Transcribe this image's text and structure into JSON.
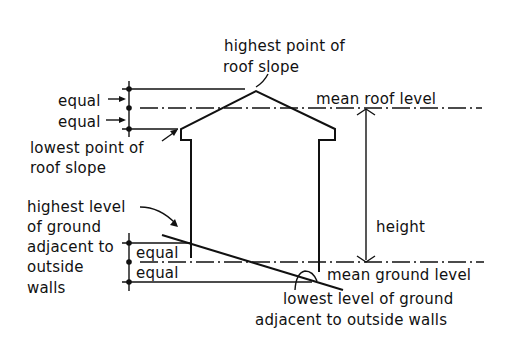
{
  "diagram": {
    "type": "building height measurement",
    "labels": {
      "highest_roof_1": "highest point of",
      "highest_roof_2": "roof slope",
      "mean_roof": "mean roof level",
      "equal_top_1": "equal",
      "equal_top_2": "equal",
      "lowest_roof_1": "lowest point of",
      "lowest_roof_2": "roof slope",
      "highest_ground_1": "highest level",
      "highest_ground_2": "of ground",
      "highest_ground_3": "adjacent to",
      "highest_ground_4": "outside",
      "highest_ground_5": "walls",
      "equal_bottom_1": "equal",
      "equal_bottom_2": "equal",
      "height": "height",
      "mean_ground": "mean ground level",
      "lowest_ground_1": "lowest level of ground",
      "lowest_ground_2": "adjacent to outside walls"
    }
  }
}
